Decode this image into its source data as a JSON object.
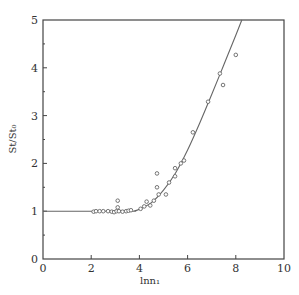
{
  "chart_data": {
    "type": "scatter",
    "title": "",
    "xlabel": "lnn₁",
    "ylabel": "St/St₀",
    "xlim": [
      0,
      10
    ],
    "ylim": [
      0,
      5
    ],
    "x_ticks": [
      0,
      2,
      4,
      6,
      8,
      10
    ],
    "y_ticks": [
      0,
      1,
      2,
      3,
      4,
      5
    ],
    "y_minor_step": 0.5,
    "grid": false,
    "legend": null,
    "series": [
      {
        "name": "measured",
        "kind": "scatter",
        "marker": "open-circle",
        "points": [
          [
            2.1,
            0.99
          ],
          [
            2.2,
            1.0
          ],
          [
            2.35,
            1.0
          ],
          [
            2.5,
            1.0
          ],
          [
            2.7,
            1.0
          ],
          [
            2.85,
            0.99
          ],
          [
            2.95,
            0.98
          ],
          [
            3.05,
            1.0
          ],
          [
            3.1,
            1.08
          ],
          [
            3.1,
            1.22
          ],
          [
            3.15,
            1.0
          ],
          [
            3.3,
            0.99
          ],
          [
            3.45,
            1.0
          ],
          [
            3.55,
            1.01
          ],
          [
            3.65,
            1.02
          ],
          [
            4.05,
            1.05
          ],
          [
            4.2,
            1.1
          ],
          [
            4.3,
            1.2
          ],
          [
            4.45,
            1.12
          ],
          [
            4.6,
            1.22
          ],
          [
            4.73,
            1.79
          ],
          [
            4.73,
            1.5
          ],
          [
            4.8,
            1.35
          ],
          [
            5.1,
            1.35
          ],
          [
            5.23,
            1.6
          ],
          [
            5.48,
            1.73
          ],
          [
            5.48,
            1.9
          ],
          [
            5.72,
            2.0
          ],
          [
            5.85,
            2.06
          ],
          [
            6.22,
            2.65
          ],
          [
            6.85,
            3.29
          ],
          [
            7.34,
            3.88
          ],
          [
            7.47,
            3.64
          ],
          [
            8.0,
            4.27
          ]
        ]
      },
      {
        "name": "fit",
        "kind": "line",
        "points": [
          [
            0,
            1.0
          ],
          [
            3.5,
            1.0
          ],
          [
            3.8,
            1.01
          ],
          [
            4.0,
            1.04
          ],
          [
            4.5,
            1.18
          ],
          [
            5.0,
            1.44
          ],
          [
            5.5,
            1.8
          ],
          [
            6.0,
            2.28
          ],
          [
            6.5,
            2.84
          ],
          [
            7.0,
            3.44
          ],
          [
            7.5,
            4.06
          ],
          [
            8.0,
            4.68
          ],
          [
            8.25,
            5.0
          ]
        ]
      }
    ]
  }
}
